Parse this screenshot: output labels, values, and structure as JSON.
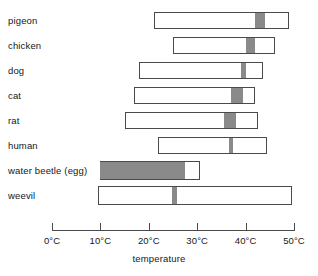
{
  "chart_data": {
    "type": "bar",
    "title": "",
    "subtitle": "",
    "xlabel": "temperature",
    "ylabel": "",
    "xlim": [
      -4,
      55
    ],
    "grid": false,
    "legend": null,
    "orientation": "horizontal",
    "unit": "°C",
    "x_ticks": [
      {
        "value": 0,
        "label": "0°C"
      },
      {
        "value": 10,
        "label": "10°C"
      },
      {
        "value": 20,
        "label": "20°C"
      },
      {
        "value": 30,
        "label": "30°C"
      },
      {
        "value": 40,
        "label": "40°C"
      },
      {
        "value": 50,
        "label": "50°C"
      }
    ],
    "categories": [
      "pigeon",
      "chicken",
      "dog",
      "cat",
      "rat",
      "human",
      "water beetle (egg)",
      "weevil"
    ],
    "series": [
      {
        "name": "tolerated temperature range",
        "style": "open-bar",
        "values": [
          {
            "category": "pigeon",
            "start": 21.0,
            "end": 49.0
          },
          {
            "category": "chicken",
            "start": 25.0,
            "end": 46.0
          },
          {
            "category": "dog",
            "start": 18.0,
            "end": 43.5
          },
          {
            "category": "cat",
            "start": 17.0,
            "end": 42.0
          },
          {
            "category": "rat",
            "start": 15.0,
            "end": 42.5
          },
          {
            "category": "human",
            "start": 22.0,
            "end": 44.5
          },
          {
            "category": "water beetle (egg)",
            "start": 10.0,
            "end": 30.5
          },
          {
            "category": "weevil",
            "start": 9.5,
            "end": 49.5
          }
        ]
      },
      {
        "name": "body / preferred temperature",
        "style": "grey-band",
        "color": "#8a8a8a",
        "values": [
          {
            "category": "pigeon",
            "start": 42.0,
            "end": 44.0
          },
          {
            "category": "chicken",
            "start": 40.0,
            "end": 42.0
          },
          {
            "category": "dog",
            "start": 39.0,
            "end": 40.0
          },
          {
            "category": "cat",
            "start": 37.0,
            "end": 39.5
          },
          {
            "category": "rat",
            "start": 35.5,
            "end": 38.0
          },
          {
            "category": "human",
            "start": 36.5,
            "end": 37.5
          },
          {
            "category": "water beetle (egg)",
            "start": 10.0,
            "end": 27.5
          },
          {
            "category": "weevil",
            "start": 24.8,
            "end": 25.8
          }
        ]
      }
    ]
  },
  "rows": [
    {
      "label": "pigeon"
    },
    {
      "label": "chicken"
    },
    {
      "label": "dog"
    },
    {
      "label": "cat"
    },
    {
      "label": "rat"
    },
    {
      "label": "human"
    },
    {
      "label": "water beetle (egg)"
    },
    {
      "label": "weevil"
    }
  ],
  "axis": {
    "title": "temperature",
    "tick_labels": [
      "0°C",
      "10°C",
      "20°C",
      "30°C",
      "40°C",
      "50°C"
    ]
  },
  "colors": {
    "marker": "#8a8a8a",
    "outline": "#4a4a4a",
    "background": "#ffffff",
    "text": "#171717"
  }
}
